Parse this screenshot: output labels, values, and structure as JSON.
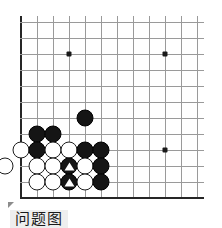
{
  "diagram": {
    "kind": "go-board-problem",
    "caption": "问题图",
    "corner_marker": "triangle-corner-mark"
  },
  "board": {
    "origin_x": 21,
    "origin_y": 22,
    "spacing": 16,
    "cols": 12,
    "rows": 12,
    "line_color": "#9a9a9a",
    "edge_color": "#262626",
    "background": "#ffffff",
    "visible_edges": [
      "left",
      "bottom"
    ],
    "star_points": [
      {
        "col": 3,
        "row": 2
      },
      {
        "col": 9,
        "row": 2
      },
      {
        "col": 9,
        "row": 8
      }
    ]
  },
  "stones": [
    {
      "col": 4,
      "row": 6,
      "color": "black",
      "mark": "none"
    },
    {
      "col": 1,
      "row": 7,
      "color": "black",
      "mark": "none"
    },
    {
      "col": 2,
      "row": 7,
      "color": "black",
      "mark": "none"
    },
    {
      "col": 0,
      "row": 8,
      "color": "white",
      "mark": "none"
    },
    {
      "col": 1,
      "row": 8,
      "color": "black",
      "mark": "none"
    },
    {
      "col": 2,
      "row": 8,
      "color": "white",
      "mark": "none"
    },
    {
      "col": 3,
      "row": 8,
      "color": "white",
      "mark": "none"
    },
    {
      "col": 4,
      "row": 8,
      "color": "black",
      "mark": "none"
    },
    {
      "col": 5,
      "row": 8,
      "color": "black",
      "mark": "none"
    },
    {
      "col": -1,
      "row": 9,
      "color": "white",
      "mark": "none"
    },
    {
      "col": 1,
      "row": 9,
      "color": "white",
      "mark": "none"
    },
    {
      "col": 2,
      "row": 9,
      "color": "white",
      "mark": "none"
    },
    {
      "col": 3,
      "row": 9,
      "color": "black",
      "mark": "triangle"
    },
    {
      "col": 4,
      "row": 9,
      "color": "white",
      "mark": "none"
    },
    {
      "col": 5,
      "row": 9,
      "color": "black",
      "mark": "none"
    },
    {
      "col": 1,
      "row": 10,
      "color": "white",
      "mark": "none"
    },
    {
      "col": 2,
      "row": 10,
      "color": "white",
      "mark": "none"
    },
    {
      "col": 3,
      "row": 10,
      "color": "black",
      "mark": "triangle"
    },
    {
      "col": 4,
      "row": 10,
      "color": "white",
      "mark": "none"
    },
    {
      "col": 5,
      "row": 10,
      "color": "black",
      "mark": "none"
    }
  ],
  "colors": {
    "black_stone": "#151515",
    "white_stone": "#ffffff",
    "stone_outline": "#1d1d1d",
    "mark": "#ffffff",
    "caption_bg": "#eeeeee",
    "caption_text": "#1a1a1a",
    "corner_mark": "#8c8c8c"
  }
}
